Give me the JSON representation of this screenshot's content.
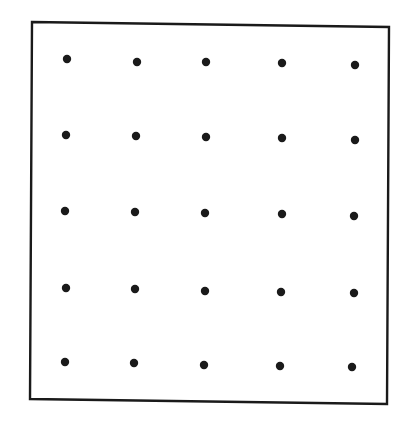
{
  "figure": {
    "width": 407,
    "height": 432,
    "background": "#ffffff",
    "frame": {
      "corners": {
        "top_left": [
          32,
          22
        ],
        "top_right": [
          389,
          27
        ],
        "bottom_right": [
          387,
          404
        ],
        "bottom_left": [
          30,
          399
        ]
      },
      "stroke": "#1a1a1a",
      "stroke_width": 2.4
    },
    "dot_grid": {
      "rows": 5,
      "cols": 5,
      "radius": 4.2,
      "color": "#1a1a1a",
      "points": [
        [
          [
            67,
            59
          ],
          [
            137,
            62
          ],
          [
            206,
            62
          ],
          [
            282,
            63
          ],
          [
            355,
            65
          ]
        ],
        [
          [
            66,
            135
          ],
          [
            136,
            136
          ],
          [
            206,
            137
          ],
          [
            282,
            138
          ],
          [
            355,
            140
          ]
        ],
        [
          [
            65,
            211
          ],
          [
            135,
            212
          ],
          [
            205,
            213
          ],
          [
            282,
            214
          ],
          [
            354,
            216
          ]
        ],
        [
          [
            66,
            288
          ],
          [
            135,
            289
          ],
          [
            205,
            291
          ],
          [
            281,
            292
          ],
          [
            354,
            293
          ]
        ],
        [
          [
            65,
            362
          ],
          [
            134,
            363
          ],
          [
            204,
            365
          ],
          [
            280,
            366
          ],
          [
            352,
            367
          ]
        ]
      ]
    }
  }
}
